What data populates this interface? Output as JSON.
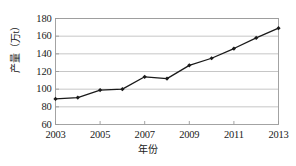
{
  "chart_data": {
    "type": "line",
    "title": "",
    "xlabel": "年份",
    "ylabel": "产量（万t）",
    "x": [
      2003,
      2004,
      2005,
      2006,
      2007,
      2008,
      2009,
      2010,
      2011,
      2012,
      2013
    ],
    "values": [
      89,
      90.5,
      99,
      100,
      114,
      112,
      127,
      135,
      146,
      158,
      169
    ],
    "series": [
      {
        "name": "产量",
        "values": [
          89,
          90.5,
          99,
          100,
          114,
          112,
          127,
          135,
          146,
          158,
          169
        ]
      }
    ],
    "xlim": [
      2003,
      2013
    ],
    "ylim": [
      60,
      180
    ],
    "y_ticks": [
      60,
      80,
      100,
      120,
      140,
      160,
      180
    ],
    "y_tick_labels": [
      "60",
      "80",
      "100",
      "120",
      "140",
      "160",
      "180"
    ],
    "x_ticks": [
      2003,
      2005,
      2007,
      2009,
      2011,
      2013
    ],
    "x_tick_labels": [
      "2003",
      "2005",
      "2007",
      "2009",
      "2011",
      "2013"
    ],
    "grid": "horizontal",
    "legend": "none",
    "line_color": "#1a1a1a",
    "marker": "diamond",
    "marker_color": "#1a1a1a",
    "grid_color": "#b8b8b8",
    "frame_color": "#9a9a9a",
    "background_color": "#ffffff"
  }
}
